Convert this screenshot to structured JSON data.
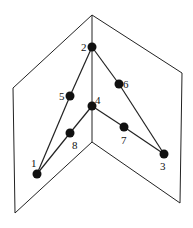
{
  "diagram": {
    "planes": {
      "spine_top": [
        92,
        15
      ],
      "spine_bottom": [
        92,
        142
      ],
      "left_top": [
        13,
        88
      ],
      "left_bottom": [
        15,
        213
      ],
      "right_top": [
        182,
        73
      ],
      "right_bottom": [
        180,
        203
      ]
    },
    "nodes": [
      {
        "id": "1",
        "label": "1",
        "x": 37,
        "y": 174,
        "lx": 31,
        "ly": 167
      },
      {
        "id": "2",
        "label": "2",
        "x": 92,
        "y": 47,
        "lx": 81,
        "ly": 51
      },
      {
        "id": "3",
        "label": "3",
        "x": 164,
        "y": 154,
        "lx": 160,
        "ly": 170
      },
      {
        "id": "4",
        "label": "4",
        "x": 92,
        "y": 106,
        "lx": 95,
        "ly": 104
      },
      {
        "id": "5",
        "label": "5",
        "x": 70,
        "y": 96,
        "lx": 59,
        "ly": 100
      },
      {
        "id": "6",
        "label": "6",
        "x": 119,
        "y": 84,
        "lx": 123,
        "ly": 88
      },
      {
        "id": "7",
        "label": "7",
        "x": 124,
        "y": 127,
        "lx": 121,
        "ly": 144
      },
      {
        "id": "8",
        "label": "8",
        "x": 70,
        "y": 133,
        "lx": 72,
        "ly": 149
      }
    ],
    "edges": [
      [
        "1",
        "5"
      ],
      [
        "5",
        "2"
      ],
      [
        "2",
        "6"
      ],
      [
        "6",
        "3"
      ],
      [
        "1",
        "8"
      ],
      [
        "8",
        "4"
      ],
      [
        "4",
        "7"
      ],
      [
        "7",
        "3"
      ]
    ],
    "colors": {
      "line": "#222222",
      "node": "#111111",
      "background": "#ffffff"
    }
  }
}
